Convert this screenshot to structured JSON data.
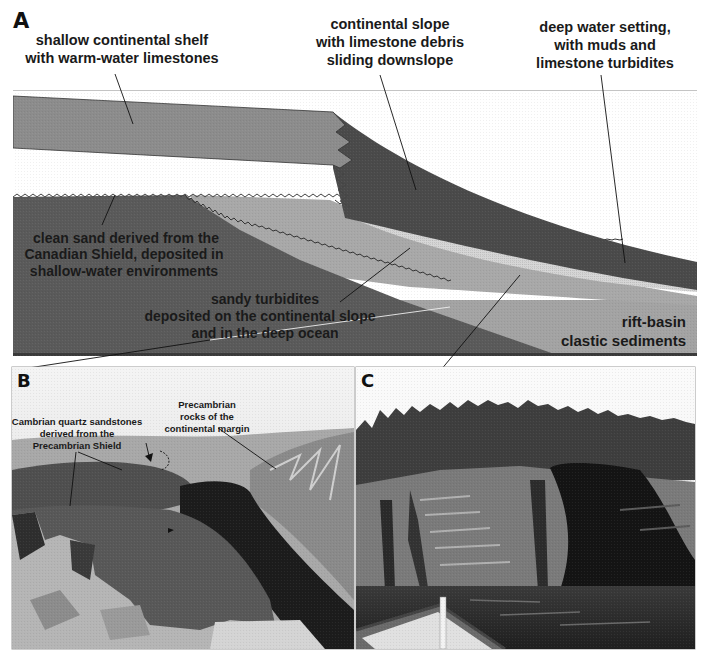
{
  "figure": {
    "panel_a": {
      "letter": "A",
      "labels": {
        "shelf": [
          "shallow continental shelf",
          "with warm-water limestones"
        ],
        "slope": [
          "continental slope",
          "with limestone debris",
          "sliding downslope"
        ],
        "deep": [
          "deep water setting,",
          "with muds and",
          "limestone turbidites"
        ],
        "clean_sand": [
          "clean sand derived from the",
          "Canadian Shield, deposited in",
          "shallow-water environments"
        ],
        "sandy_turbidites": [
          "sandy turbidites",
          "deposited on the continental  slope",
          "and in the deep ocean"
        ],
        "rift_basin": [
          "rift-basin",
          "clastic sediments"
        ]
      },
      "colors": {
        "shelf_limestone": "#8c8c8c",
        "slope_mud": "#4a4a4a",
        "turbidite_light": "#d4d4d4",
        "sandy_turbidite": "#a6a6a6",
        "clean_sand": "#5a5a5a",
        "rift_basin": "#a3a3a3",
        "background": "#ffffff"
      }
    },
    "panel_b": {
      "letter": "B",
      "labels": {
        "cambrian": [
          "Cambrian quartz sandstones",
          "derived from the",
          "Precambrian Shield"
        ],
        "precambrian": [
          "Precambrian",
          "rocks of the",
          "continental margin"
        ]
      }
    },
    "panel_c": {
      "letter": "C"
    }
  }
}
